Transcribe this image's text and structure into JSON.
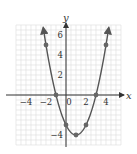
{
  "chart_data": {
    "type": "line",
    "title": "",
    "xlabel": "x",
    "ylabel": "y",
    "equation": "y = x^2 - 2x - 3",
    "xlim": [
      -5,
      5.5
    ],
    "ylim": [
      -5,
      7
    ],
    "grid": true,
    "x_ticks": [
      -4,
      -2,
      0,
      2,
      4
    ],
    "y_ticks": [
      -4,
      2,
      4,
      6
    ],
    "x_tick_labels": [
      "−4",
      "−2",
      "0",
      "2",
      "4"
    ],
    "y_tick_labels": [
      "−4",
      "2",
      "4",
      "6"
    ],
    "series": [
      {
        "name": "parabola",
        "color": "#555555",
        "points": [
          {
            "x": -2,
            "y": 5
          },
          {
            "x": -1,
            "y": 0
          },
          {
            "x": 0,
            "y": -3
          },
          {
            "x": 1,
            "y": -4
          },
          {
            "x": 2,
            "y": -3
          },
          {
            "x": 3,
            "y": 0
          },
          {
            "x": 4,
            "y": 5
          }
        ]
      }
    ]
  },
  "colors": {
    "grid": "#dcdcdc",
    "axis": "#333333",
    "curve": "#555555",
    "point": "#666666"
  },
  "labels": {
    "x_axis": "x",
    "y_axis": "y"
  }
}
